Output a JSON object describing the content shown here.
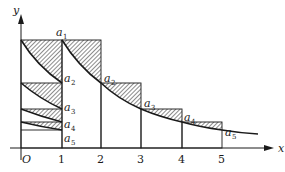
{
  "diagram": {
    "axes": {
      "x_label": "x",
      "y_label": "y",
      "origin_label": "O",
      "x_ticks": [
        "1",
        "2",
        "3",
        "4",
        "5"
      ]
    },
    "sequence_labels": [
      {
        "base": "a",
        "sub": "1"
      },
      {
        "base": "a",
        "sub": "2"
      },
      {
        "base": "a",
        "sub": "3"
      },
      {
        "base": "a",
        "sub": "4"
      },
      {
        "base": "a",
        "sub": "5"
      }
    ],
    "left_labels": [
      {
        "base": "a",
        "sub": "2"
      },
      {
        "base": "a",
        "sub": "3"
      },
      {
        "base": "a",
        "sub": "4"
      },
      {
        "base": "a",
        "sub": "5"
      }
    ],
    "colors": {
      "ink": "#1a1a1a",
      "background": "#ffffff"
    }
  }
}
